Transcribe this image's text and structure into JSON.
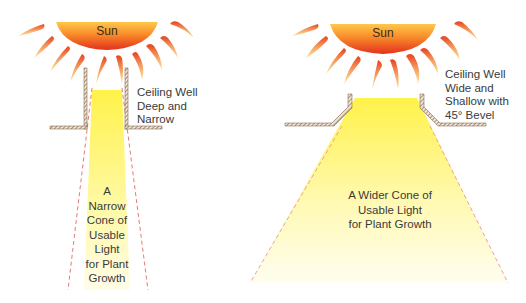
{
  "left": {
    "sun_label": "Sun",
    "well_label": [
      "Ceiling Well",
      "Deep and",
      "Narrow"
    ],
    "cone_label": [
      "A",
      "Narrow",
      "Cone of",
      "Usable",
      "Light",
      "for Plant",
      "Growth"
    ]
  },
  "right": {
    "sun_label": "Sun",
    "well_label": [
      "Ceiling Well",
      "Wide and",
      "Shallow with",
      "45° Bevel"
    ],
    "cone_label": [
      "A Wider Cone of",
      "Usable Light",
      "for Plant Growth"
    ]
  },
  "colors": {
    "sun_outer": "#ffd04a",
    "sun_inner": "#e8321a",
    "light": "#fff36a",
    "cone_edge": "#e87070",
    "wall": "#8a6a4a"
  }
}
